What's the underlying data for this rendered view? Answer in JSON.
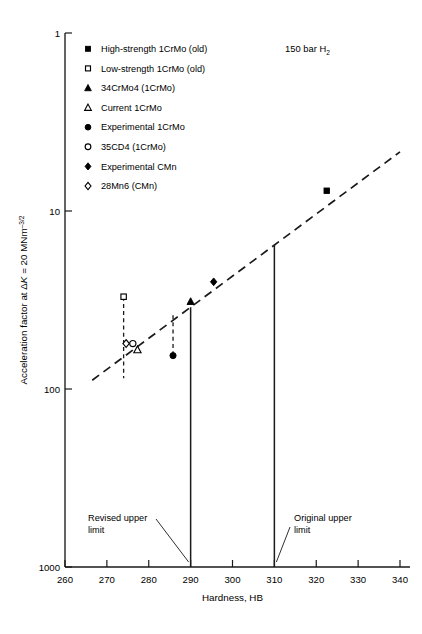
{
  "chart_data": {
    "type": "scatter",
    "title": "",
    "xlabel": "Hardness, HB",
    "ylabel": "Acceleration factor at ΔK = 20 MNm⁻³ᐟ²",
    "ylabel_parts": {
      "pre": "Acceleration factor at ",
      "k": "K",
      "mid": " = 20 MNm",
      "exp": "–3/2",
      "delta": "Δ"
    },
    "xlim": [
      260,
      340
    ],
    "ylim": [
      1,
      1000
    ],
    "yscale": "log",
    "xscale": "linear",
    "grid": false,
    "xticks": [
      260,
      270,
      280,
      290,
      300,
      310,
      320,
      330,
      340
    ],
    "yticks": [
      1,
      10,
      100,
      1000
    ],
    "condition_label": "150 bar H2",
    "condition_label_parts": {
      "text": "150 bar H",
      "sub": "2"
    },
    "legend_position": "upper-left-inside",
    "legend": [
      {
        "key": "high-strength-1crmo-old",
        "label": "High-strength 1CrMo (old)",
        "marker": "filled-square"
      },
      {
        "key": "low-strength-1crmo-old",
        "label": "Low-strength 1CrMo (old)",
        "marker": "open-square"
      },
      {
        "key": "34crmo4-1crmo",
        "label": "34CrMo4 (1CrMo)",
        "marker": "filled-triangle"
      },
      {
        "key": "current-1crmo",
        "label": "Current 1CrMo",
        "marker": "open-triangle"
      },
      {
        "key": "experimental-1crmo",
        "label": "Experimental 1CrMo",
        "marker": "filled-circle"
      },
      {
        "key": "35cd4-1crmo",
        "label": "35CD4 (1CrMo)",
        "marker": "open-circle"
      },
      {
        "key": "experimental-cmn",
        "label": "Experimental CMn",
        "marker": "filled-diamond"
      },
      {
        "key": "28mn6-cmn",
        "label": "28Mn6 (CMn)",
        "marker": "open-diamond"
      }
    ],
    "points": [
      {
        "key": "low-strength-1crmo-old",
        "marker": "open-square",
        "x": 274.0,
        "y": 33.0
      },
      {
        "key": "28mn6-cmn",
        "marker": "open-diamond",
        "x": 274.6,
        "y": 18.0
      },
      {
        "key": "35cd4-1crmo",
        "marker": "open-circle",
        "x": 276.2,
        "y": 18.0
      },
      {
        "key": "current-1crmo",
        "marker": "open-triangle",
        "x": 277.3,
        "y": 16.6
      },
      {
        "key": "experimental-1crmo",
        "marker": "filled-circle",
        "x": 285.8,
        "y": 15.4
      },
      {
        "key": "34crmo4-1crmo",
        "marker": "filled-triangle",
        "x": 290.0,
        "y": 31.0
      },
      {
        "key": "experimental-cmn",
        "marker": "filled-diamond",
        "x": 295.5,
        "y": 40.0
      },
      {
        "key": "high-strength-1crmo-old",
        "marker": "filled-square",
        "x": 322.5,
        "y": 130.0
      }
    ],
    "trendline": {
      "style": "dashed",
      "x0": 266.5,
      "y0": 11.2,
      "x1": 340.0,
      "y1": 215.0
    },
    "error_bars": [
      {
        "key": "low-strength-1crmo-old",
        "x": 274.0,
        "y_top": 33.0,
        "y_bottom": 11.5,
        "style": "dashed"
      },
      {
        "key": "experimental-1crmo",
        "x": 285.8,
        "y_top": 26.0,
        "y_bottom": 15.4,
        "style": "dashed"
      }
    ],
    "reference_lines": [
      {
        "key": "revised-upper-limit",
        "x": 290.0,
        "label": "Revised upper\nlimit",
        "label_line1": "Revised upper",
        "label_line2": "limit",
        "style": "solid"
      },
      {
        "key": "original-upper-limit",
        "x": 310.0,
        "label": "Original upper\nlimit",
        "label_line1": "Original upper",
        "label_line2": "limit",
        "style": "solid"
      }
    ]
  },
  "axis": {
    "y_tick_labels": [
      "1000",
      "100",
      "10",
      "1"
    ],
    "x_tick_labels": [
      "260",
      "270",
      "280",
      "290",
      "300",
      "310",
      "320",
      "330",
      "340"
    ],
    "x_title": "Hardness, HB"
  },
  "colors": {
    "ink": "#1a1a1a",
    "paper": "#ffffff"
  }
}
